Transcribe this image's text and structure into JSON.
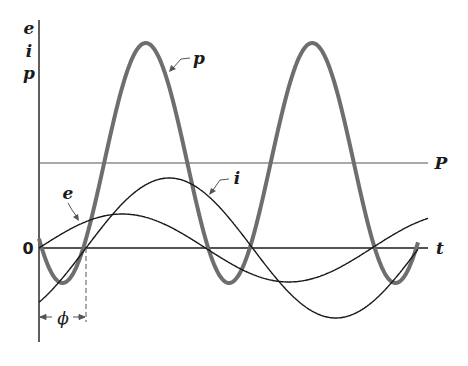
{
  "diagram": {
    "type": "ac-power-waveforms",
    "axis_labels": {
      "y_top": "e",
      "y_mid": "i",
      "y_bottom": "p",
      "x": "t",
      "origin": "0"
    },
    "curve_labels": {
      "power": "p",
      "current": "i",
      "voltage": "e",
      "average_power": "P"
    },
    "phase_label": "ϕ",
    "colors": {
      "power_curve": "#6e6e6e",
      "other_curves": "#1a1a1a",
      "axis": "#1a1a1a",
      "average_line": "#555555"
    }
  },
  "chart_data": {
    "type": "line",
    "title": "",
    "xlabel": "t",
    "ylabel": "e i p",
    "series": [
      {
        "name": "e",
        "description": "voltage sinusoid starting at 0, amplitude ~34 units",
        "amplitude": 34,
        "phase_shift": 0
      },
      {
        "name": "i",
        "description": "current sinusoid lagging e by phi, amplitude ~70 units",
        "amplitude": 70,
        "phase_shift": "phi (lag)"
      },
      {
        "name": "p",
        "description": "instantaneous power p = e*i, double frequency, max ~205, min ~-35",
        "max": 205,
        "min": -35
      },
      {
        "name": "P",
        "description": "average power horizontal line",
        "value": 85
      }
    ],
    "annotations": [
      "phi: phase difference between e and i zero crossings"
    ]
  }
}
